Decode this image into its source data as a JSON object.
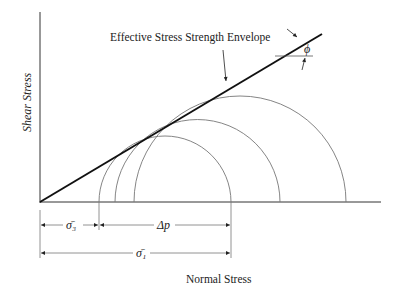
{
  "diagram": {
    "title_label": "Effective Stress Strength Envelope",
    "y_axis_label": "Shear Stress",
    "x_axis_label": "Normal Stress",
    "angle_label": "ϕ",
    "dim_sigma3": "σ̄₃",
    "dim_delta_p": "Δp",
    "dim_sigma1": "σ̄₁",
    "colors": {
      "line": "#111111",
      "circle": "#777777",
      "text": "#222222"
    }
  }
}
